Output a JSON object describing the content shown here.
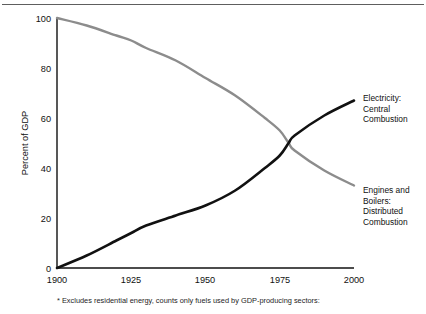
{
  "figure": {
    "top_caption": "",
    "footnote": "* Excludes residential energy, counts only fuels used by GDP-producing sectors:"
  },
  "labels": {
    "electricity_line1": "Electricity:",
    "electricity_line2": "Central",
    "electricity_line3": "Combustion",
    "engines_line1": "Engines and",
    "engines_line2": "Boilers:",
    "engines_line3": "Distributed",
    "engines_line4": "Combustion"
  },
  "axes": {
    "ylabel": "Percent of GDP",
    "yticks": [
      "100",
      "80",
      "60",
      "40",
      "20",
      "0"
    ],
    "xticks": [
      "1900",
      "1925",
      "1950",
      "1975",
      "2000"
    ]
  },
  "colors": {
    "electricity": "#111111",
    "engines": "#8c8c8c",
    "axis": "#111111",
    "rule": "#5e5e5e",
    "background": "#ffffff"
  },
  "chart_data": {
    "type": "line",
    "title": "",
    "xlabel": "",
    "ylabel": "Percent of GDP",
    "xlim": [
      1900,
      2000
    ],
    "ylim": [
      0,
      100
    ],
    "xticks": [
      1900,
      1925,
      1950,
      1975,
      2000
    ],
    "yticks": [
      0,
      20,
      40,
      60,
      80,
      100
    ],
    "grid": false,
    "legend": "right-inline-labels",
    "annotations": [
      "* Excludes residential energy, counts only fuels used by GDP-producing sectors:"
    ],
    "x": [
      1900,
      1910,
      1920,
      1925,
      1930,
      1940,
      1950,
      1960,
      1970,
      1975,
      1978,
      1980,
      1990,
      2000
    ],
    "series": [
      {
        "name": "Engines and Boilers: Distributed Combustion",
        "color": "#8c8c8c",
        "values": [
          100,
          97,
          93,
          91,
          88,
          83,
          76,
          69,
          60,
          55,
          50,
          47,
          39,
          33
        ]
      },
      {
        "name": "Electricity: Central Combustion",
        "color": "#111111",
        "values": [
          0,
          5,
          11,
          14,
          17,
          21,
          25,
          31,
          40,
          45,
          50,
          53,
          61,
          67
        ]
      }
    ]
  }
}
